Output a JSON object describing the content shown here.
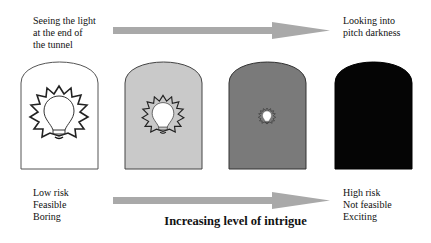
{
  "diagram": {
    "top_left_label": "Seeing the light\nat the end of\nthe tunnel",
    "top_right_label": "Looking into\npitch darkness",
    "bottom_left_label": "Low risk\nFeasible\nBoring",
    "bottom_right_label": "High risk\nNot feasible\nExciting",
    "axis_title": "Increasing level of intrigue",
    "panels": [
      {
        "name": "panel-1",
        "fill": "#ffffff",
        "bulb_scale": 1.0,
        "bulb_visible": true
      },
      {
        "name": "panel-2",
        "fill": "#c9c9c9",
        "bulb_scale": 0.72,
        "bulb_visible": true
      },
      {
        "name": "panel-3",
        "fill": "#7a7a7a",
        "bulb_scale": 0.3,
        "bulb_visible": true
      },
      {
        "name": "panel-4",
        "fill": "#050505",
        "bulb_scale": 0,
        "bulb_visible": false
      }
    ],
    "arrow_color": "#a9a9a9"
  }
}
